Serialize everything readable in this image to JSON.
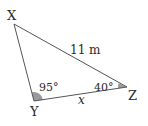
{
  "diagram": {
    "type": "triangle",
    "vertices": {
      "X": {
        "label": "X",
        "x": 14,
        "y": 24
      },
      "Y": {
        "label": "Y",
        "x": 34,
        "y": 101
      },
      "Z": {
        "label": "Z",
        "x": 127,
        "y": 87
      }
    },
    "sides": {
      "XZ": {
        "label": "11 m"
      },
      "YZ": {
        "label": "x"
      }
    },
    "angles": {
      "Y": {
        "label": "95°"
      },
      "Z": {
        "label": "40°"
      }
    },
    "colors": {
      "line": "#555555",
      "angle_fill": "#9a9a9a",
      "text": "#2a2a2a",
      "background": "#ffffff"
    }
  }
}
